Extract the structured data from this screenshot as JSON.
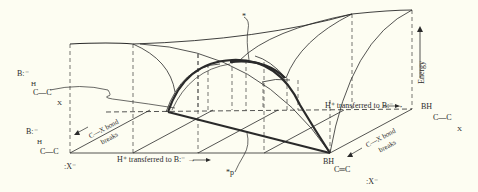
{
  "figure": {
    "type": "More O'Ferrall–Jencks reaction coordinate diagram (3D energy surface)",
    "colors": {
      "background": "#fdfdf2",
      "line": "#2a2a2a",
      "dashed": "#3a3a3a"
    }
  },
  "axes": {
    "front_axis_label": "H⁺ transferred to B:⁻ →",
    "back_axis_label": "H⁺ transferred to B:⁻ →",
    "depth_axis_left_label_line1": "C—X bond",
    "depth_axis_left_label_line2": "breaks",
    "depth_axis_right_label_line1": "C—X bond",
    "depth_axis_right_label_line2": "breaks",
    "vertical_axis_label": "Energy"
  },
  "corners": {
    "top_left_back": {
      "base": "B:⁻",
      "line1": "H",
      "line2": "C—C",
      "line3": "X"
    },
    "bottom_left_front": {
      "base": "B:⁻",
      "line1": "H",
      "line2": "C—C",
      "leaving": ":X⁻"
    },
    "top_right_back": {
      "base": "BH",
      "line2": "C—C",
      "line3": "X"
    },
    "bottom_right_front": {
      "base": "BH",
      "line2": "C═C",
      "leaving": ":X⁻"
    }
  },
  "annotations": {
    "transition_state": "*",
    "projection": "*p"
  }
}
